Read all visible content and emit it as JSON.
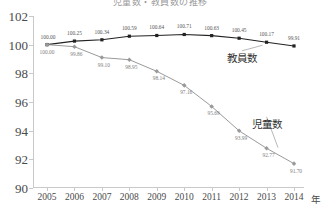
{
  "chart_data": {
    "type": "line",
    "title": "児童数・教員数の推移",
    "xlabel": "年",
    "ylabel": "",
    "ylim": [
      90,
      102
    ],
    "yticks": [
      90,
      92,
      94,
      96,
      98,
      100,
      102
    ],
    "xticks": [
      "2005",
      "2006",
      "2007",
      "2008",
      "2009",
      "2010",
      "2011",
      "2012",
      "2013",
      "2014"
    ],
    "x": [
      2005,
      2006,
      2007,
      2008,
      2009,
      2010,
      2011,
      2012,
      2013,
      2014
    ],
    "grid": false,
    "legend_position": "inline-annotation",
    "series": [
      {
        "name": "教員数",
        "color": "#222222",
        "marker": "square",
        "values": [
          100.0,
          100.25,
          100.34,
          100.59,
          100.64,
          100.71,
          100.63,
          100.45,
          100.17,
          99.91
        ],
        "labels": [
          "100.00",
          "100.25",
          "100.34",
          "100.59",
          "100.64",
          "100.71",
          "100.63",
          "100.45",
          "100.17",
          "99.91"
        ]
      },
      {
        "name": "児童数",
        "color": "#9a9a9a",
        "marker": "diamond",
        "values": [
          100.0,
          99.86,
          99.1,
          98.95,
          98.14,
          97.16,
          95.69,
          93.99,
          92.77,
          91.7
        ],
        "labels": [
          "100.00",
          "99.86",
          "99.10",
          "98.95",
          "98.14",
          "97.16",
          "95.69",
          "93.99",
          "92.77",
          "91.70"
        ]
      }
    ],
    "annotations": [
      {
        "text": "教員数",
        "x": 2012.1,
        "y": 99.15
      },
      {
        "text": "児童数",
        "x": 2013.0,
        "y": 94.55
      }
    ],
    "axis_color": "#c9c9c9",
    "text_color": "#4a4a4a"
  }
}
